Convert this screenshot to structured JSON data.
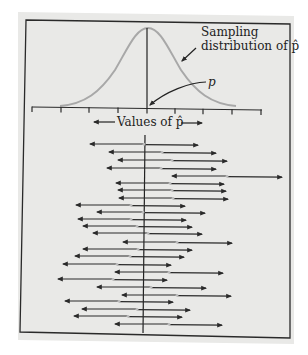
{
  "figure": {
    "annotations": {
      "sampling_line1": "Sampling",
      "sampling_line2": "distribution of p̂",
      "p_label": "p",
      "axis_label": "Values of p̂"
    },
    "colors": {
      "panel": "#e9e9e7",
      "ink": "#2a2a2a",
      "curve": "#a8a8a8",
      "phat_marker": "#bdbdbd"
    }
  },
  "chart_data": {
    "type": "diagram",
    "curve": "Sampling distribution of p̂ (normal, centered at p)",
    "xlabel": "Values of p̂",
    "true_value_label": "p",
    "axis_ticks_px": [
      32,
      61,
      89,
      118,
      147,
      175,
      203,
      232,
      261
    ],
    "center_px": 145,
    "intervals": [
      {
        "y": 144,
        "left": 90,
        "center": 144,
        "right": 198
      },
      {
        "y": 152,
        "left": 109,
        "center": 162,
        "right": 216
      },
      {
        "y": 160,
        "left": 118,
        "center": 172,
        "right": 227
      },
      {
        "y": 168,
        "left": 107,
        "center": 161,
        "right": 216
      },
      {
        "y": 176,
        "left": 172,
        "center": 227,
        "right": 282
      },
      {
        "y": 183,
        "left": 116,
        "center": 170,
        "right": 224
      },
      {
        "y": 190,
        "left": 118,
        "center": 172,
        "right": 226
      },
      {
        "y": 198,
        "left": 119,
        "center": 173,
        "right": 228
      },
      {
        "y": 205,
        "left": 76,
        "center": 131,
        "right": 185
      },
      {
        "y": 212,
        "left": 97,
        "center": 143,
        "right": 205
      },
      {
        "y": 219,
        "left": 78,
        "center": 131,
        "right": 186
      },
      {
        "y": 226,
        "left": 83,
        "center": 137,
        "right": 192
      },
      {
        "y": 233,
        "left": 93,
        "center": 148,
        "right": 202
      },
      {
        "y": 242,
        "left": 123,
        "center": 177,
        "right": 232
      },
      {
        "y": 249,
        "left": 83,
        "center": 138,
        "right": 192
      },
      {
        "y": 256,
        "left": 75,
        "center": 130,
        "right": 184
      },
      {
        "y": 264,
        "left": 63,
        "center": 117,
        "right": 171
      },
      {
        "y": 272,
        "left": 115,
        "center": 169,
        "right": 223
      },
      {
        "y": 279,
        "left": 58,
        "center": 113,
        "right": 167
      },
      {
        "y": 287,
        "left": 97,
        "center": 151,
        "right": 206
      },
      {
        "y": 295,
        "left": 122,
        "center": 177,
        "right": 231
      },
      {
        "y": 301,
        "left": 65,
        "center": 119,
        "right": 173
      },
      {
        "y": 309,
        "left": 82,
        "center": 137,
        "right": 190
      },
      {
        "y": 316,
        "left": 74,
        "center": 128,
        "right": 182
      },
      {
        "y": 324,
        "left": 115,
        "center": 169,
        "right": 222
      }
    ]
  }
}
